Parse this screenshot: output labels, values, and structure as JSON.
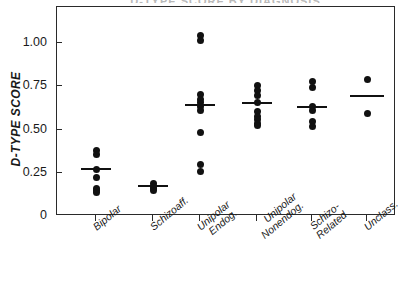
{
  "figure": {
    "clipped_title": "D-TYPE SCORE BY DIAGNOSIS",
    "background_color": "#ffffff",
    "marker_color": "#111111",
    "axis_color": "#2a2a2a"
  },
  "chart_data": {
    "type": "scatter",
    "title": "",
    "xlabel": "",
    "ylabel": "D-TYPE SCORE",
    "ylim": [
      0,
      1.15
    ],
    "yticks": [
      0,
      0.25,
      0.5,
      0.75,
      1.0
    ],
    "ytick_labels": [
      "0",
      "0.25",
      "0.50",
      "0.75",
      "1.00"
    ],
    "grid": false,
    "legend": "none",
    "marker": "filled-circle",
    "overlay": "group-mean-horizontal-bar",
    "categories": [
      "Bipolar",
      "Schizoaff.",
      "Unipolar Endog.",
      "Unipolar Nonendog.",
      "Schizo-Related",
      "Unclass."
    ],
    "category_label_lines": [
      [
        "Bipolar"
      ],
      [
        "Schizoaff."
      ],
      [
        "Unipolar",
        "Endog."
      ],
      [
        "Unipolar",
        "Nonendog."
      ],
      [
        "Schizo-",
        "Related"
      ],
      [
        "Unclass."
      ]
    ],
    "groups": [
      {
        "name": "Bipolar",
        "n": 7,
        "mean": 0.27,
        "values": [
          0.38,
          0.355,
          0.27,
          0.225,
          0.16,
          0.145,
          0.135
        ]
      },
      {
        "name": "Schizoaff.",
        "n": 4,
        "mean": 0.17,
        "values": [
          0.185,
          0.17,
          0.16,
          0.15
        ]
      },
      {
        "name": "Unipolar Endog.",
        "n": 10,
        "mean": 0.64,
        "values": [
          1.045,
          1.015,
          0.7,
          0.675,
          0.655,
          0.635,
          0.61,
          0.485,
          0.3,
          0.255
        ]
      },
      {
        "name": "Unipolar Nonendog.",
        "n": 9,
        "mean": 0.655,
        "values": [
          0.755,
          0.725,
          0.695,
          0.655,
          0.605,
          0.575,
          0.555,
          0.535,
          0.525
        ]
      },
      {
        "name": "Schizo-Related",
        "n": 6,
        "mean": 0.63,
        "values": [
          0.78,
          0.74,
          0.635,
          0.61,
          0.545,
          0.515
        ]
      },
      {
        "name": "Unclass.",
        "n": 2,
        "mean": 0.695,
        "values": [
          0.79,
          0.595
        ]
      }
    ]
  }
}
